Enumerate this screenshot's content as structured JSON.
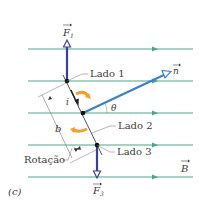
{
  "figure": {
    "panel_label": "(c)",
    "colors": {
      "field_line": "#4fa488",
      "force_arrow": "#3d3f8f",
      "normal_vector": "#3b82c4",
      "rotation_arrow": "#f0a030",
      "coil_edge": "#555555",
      "leader_line": "#888888",
      "text": "#3a3a3a"
    },
    "field_lines_y": [
      49,
      81,
      113,
      145,
      177
    ],
    "labels": {
      "f1": "F",
      "f1_sub": "1",
      "f3": "F",
      "f3_sub": "3",
      "n": "n",
      "b_field": "B",
      "lado1": "Lado 1",
      "lado2": "Lado 2",
      "lado3": "Lado 3",
      "rotation": "Rotação",
      "current": "i",
      "width": "b",
      "angle": "θ"
    }
  }
}
